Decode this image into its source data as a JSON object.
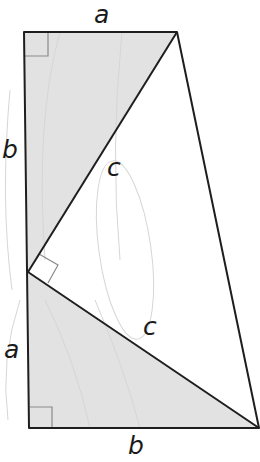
{
  "figure": {
    "colors": {
      "background": "#ffffff",
      "shaded_triangle_fill": "#e2e2e2",
      "outline": "#1e1e1e",
      "right_angle_marker": "#8a8a8a",
      "faint_marks": "#d6d6d6"
    },
    "vertices": {
      "top_left": [
        24,
        32
      ],
      "top_right": [
        177,
        32
      ],
      "middle_left": [
        28,
        272
      ],
      "bottom_left": [
        29,
        428
      ],
      "bottom_right": [
        259,
        428
      ]
    },
    "shapes": [
      {
        "name": "upper-right-triangle",
        "vertices": [
          "top_left",
          "top_right",
          "middle_left"
        ],
        "shaded": true,
        "legs": [
          "a",
          "b"
        ],
        "hypotenuse": "c"
      },
      {
        "name": "lower-right-triangle",
        "vertices": [
          "middle_left",
          "bottom_left",
          "bottom_right"
        ],
        "shaded": true,
        "legs": [
          "a",
          "b"
        ],
        "hypotenuse": "c"
      },
      {
        "name": "central-isosceles-right-triangle",
        "vertices": [
          "top_right",
          "middle_left",
          "bottom_right"
        ],
        "shaded": false,
        "legs": [
          "c",
          "c"
        ]
      }
    ],
    "right_angle_markers": [
      "top_left",
      "bottom_left",
      "middle_left"
    ],
    "labels": {
      "top_edge": "a",
      "left_upper": "b",
      "hyp_upper": "c",
      "left_lower": "a",
      "hyp_lower": "c",
      "bottom_edge": "b"
    }
  }
}
